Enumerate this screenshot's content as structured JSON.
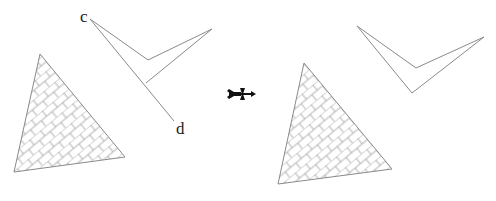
{
  "diagram": {
    "labels": {
      "c": "c",
      "d": "d"
    },
    "arrow_icon": "fletched-arrow-icon",
    "colors": {
      "stroke": "#8a8a8a",
      "hatch": "#9a9a9a",
      "text": "#222222",
      "arrow": "#111111"
    },
    "before": {
      "triangle": [
        [
          40,
          54
        ],
        [
          14,
          172
        ],
        [
          125,
          157
        ]
      ],
      "chevron": [
        [
          90,
          19
        ],
        [
          148,
          60
        ],
        [
          212,
          29
        ],
        [
          146,
          83
        ]
      ],
      "fold_line": [
        [
          90,
          19
        ],
        [
          174,
          121
        ]
      ]
    },
    "after": {
      "triangle": [
        [
          304,
          63
        ],
        [
          278,
          184
        ],
        [
          392,
          169
        ]
      ],
      "chevron": [
        [
          357,
          26
        ],
        [
          416,
          68
        ],
        [
          484,
          37
        ],
        [
          412,
          93
        ]
      ]
    }
  }
}
